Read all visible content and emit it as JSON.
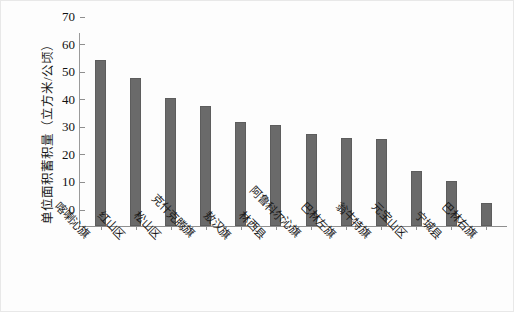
{
  "chart_data": {
    "type": "bar",
    "title": "",
    "xlabel": "",
    "ylabel": "单位面积蓄积量（立方米/公顷）",
    "ylim": [
      0,
      70
    ],
    "yticks": [
      0,
      10,
      20,
      30,
      40,
      50,
      60,
      70
    ],
    "grid": false,
    "legend": false,
    "bar_color": "#6a6a6a",
    "categories": [
      "喀喇沁旗",
      "红山区",
      "松山区",
      "克什克腾旗",
      "敖汉旗",
      "林西县",
      "阿鲁科尔沁旗",
      "巴林左旗",
      "翁牛特旗",
      "元宝山区",
      "宁城县",
      "巴林右旗"
    ],
    "values": [
      60.3,
      53.8,
      46.6,
      43.6,
      37.9,
      36.6,
      33.5,
      32.0,
      31.7,
      19.8,
      16.4,
      8.4
    ]
  }
}
